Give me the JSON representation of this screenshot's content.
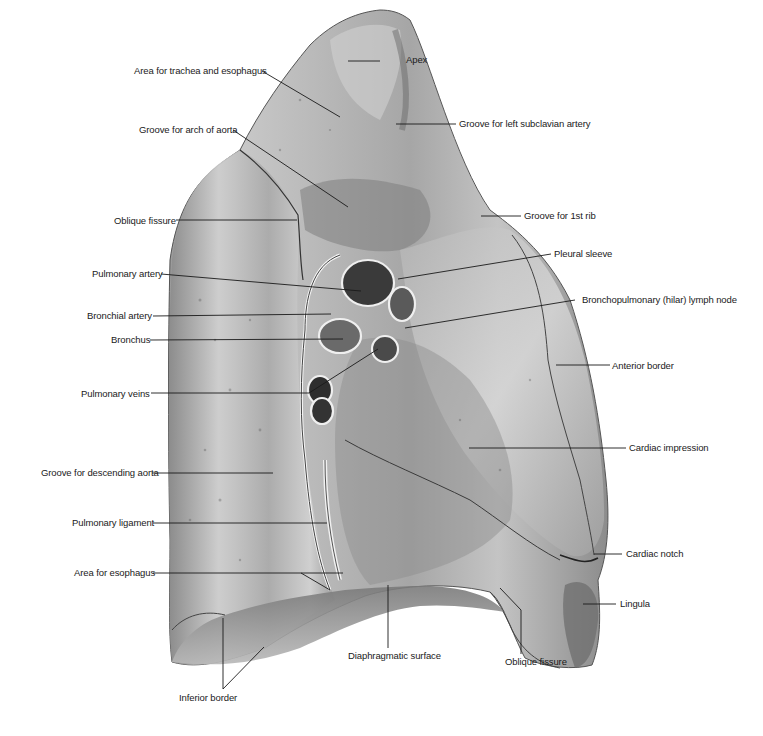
{
  "figure": {
    "colors": {
      "background": "#ffffff",
      "leader": "#1a1a1a",
      "label": "#1a1a1a"
    },
    "labels": {
      "apex": "Apex",
      "area_trachea_esophagus": "Area for trachea and esophagus",
      "groove_left_subclavian": "Groove for left subclavian artery",
      "groove_arch_aorta": "Groove for arch of aorta",
      "groove_1st_rib": "Groove for 1st rib",
      "oblique_fissure_upper": "Oblique fissure",
      "pleural_sleeve": "Pleural sleeve",
      "pulmonary_artery": "Pulmonary artery",
      "bronchopulmonary_lymph_node": "Bronchopulmonary (hilar) lymph node",
      "bronchial_artery": "Bronchial artery",
      "bronchus": "Bronchus",
      "anterior_border": "Anterior border",
      "pulmonary_veins": "Pulmonary veins",
      "cardiac_impression": "Cardiac impression",
      "groove_descending_aorta": "Groove for descending aorta",
      "pulmonary_ligament": "Pulmonary ligament",
      "cardiac_notch": "Cardiac notch",
      "area_esophagus": "Area for esophagus",
      "lingula": "Lingula",
      "diaphragmatic_surface": "Diaphragmatic surface",
      "oblique_fissure_lower": "Oblique fissure",
      "inferior_border": "Inferior border"
    }
  }
}
